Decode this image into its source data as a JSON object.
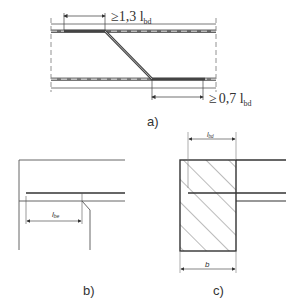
{
  "figure": {
    "panel_a": {
      "caption": "a)",
      "top_dim": {
        "prefix": "≥",
        "value": "1,3 l",
        "subscript": "bd"
      },
      "bottom_dim": {
        "prefix": "≥",
        "value": "0,7 l",
        "subscript": "bd"
      }
    },
    "panel_b": {
      "caption": "b)",
      "dim": {
        "value": "l",
        "subscript": "be"
      }
    },
    "panel_c": {
      "caption": "c)",
      "top_dim": {
        "value": "l",
        "subscript": "bd"
      },
      "bottom_dim": {
        "value": "b"
      }
    },
    "colors": {
      "line": "#333333",
      "bar": "#555555",
      "dash": "#dddddd",
      "hatch": "#555555"
    }
  }
}
